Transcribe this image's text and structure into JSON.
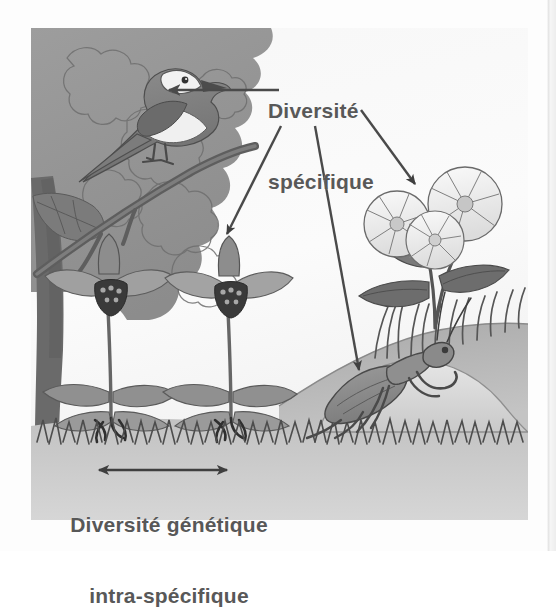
{
  "figure": {
    "kind": "biology-diagram",
    "language": "fr",
    "background_color": "#f4f4f4",
    "text_color": "#585858",
    "line_color": "#4a4a4a"
  },
  "labels": {
    "specifique": {
      "line1": "Diversité",
      "line2": "spécifique"
    },
    "genetique": {
      "line1": "Diversité génétique",
      "line2": "intra-spécifique"
    }
  },
  "annotations": {
    "leader_line_to_bird": "leader-line-bird",
    "arrow_to_orchid": "arrow-orchid",
    "arrow_to_mantis": "arrow-mantis",
    "arrow_to_bindweed": "arrow-bindweed",
    "double_arrow_between_orchids": "double-arrow-genetic-diversity"
  },
  "scene": {
    "organisms": [
      {
        "name": "bird",
        "label": "oiseau",
        "position": "upper-left"
      },
      {
        "name": "orchid-left",
        "label": "orchidée (Ophrys)",
        "position": "mid-left"
      },
      {
        "name": "orchid-right",
        "label": "orchidée (Ophrys)",
        "position": "mid-center"
      },
      {
        "name": "bindweed",
        "label": "liseron",
        "position": "right"
      },
      {
        "name": "mantis",
        "label": "mante religieuse",
        "position": "lower-right"
      }
    ],
    "elements": [
      {
        "name": "tree-trunk",
        "position": "left-edge"
      },
      {
        "name": "foliage",
        "position": "upper-left"
      },
      {
        "name": "grass-band",
        "position": "bottom"
      },
      {
        "name": "hill-mound",
        "position": "lower-right"
      },
      {
        "name": "sky",
        "position": "center"
      }
    ]
  }
}
